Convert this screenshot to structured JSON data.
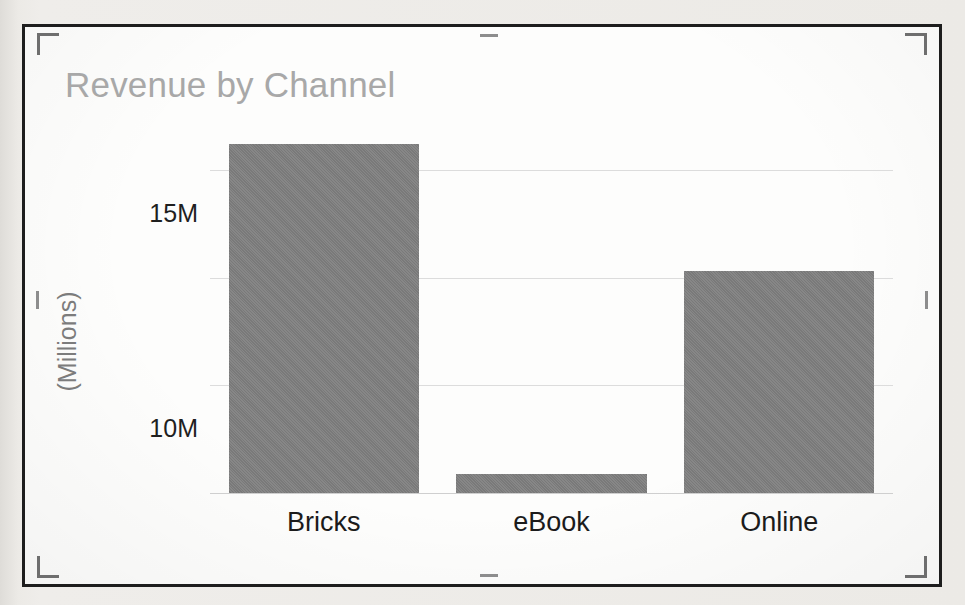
{
  "figure": {
    "crop_marks": [
      {
        "name": "crop-mark-top-left"
      },
      {
        "name": "crop-mark-top-right"
      },
      {
        "name": "crop-mark-bottom-left"
      },
      {
        "name": "crop-mark-bottom-right"
      }
    ],
    "edge_ticks": [
      {
        "name": "edge-tick-top"
      },
      {
        "name": "edge-tick-bottom"
      },
      {
        "name": "edge-tick-left"
      },
      {
        "name": "edge-tick-right"
      }
    ],
    "frame_color": "#1d1d1d",
    "page_background": "#e9e9e7",
    "figure_background": "#fdfdfc"
  },
  "chart_data": {
    "type": "bar",
    "title": "Revenue by Channel",
    "xlabel": "",
    "ylabel": "(Millions)",
    "categories": [
      "Bricks",
      "eBook",
      "Online"
    ],
    "values": [
      16.2,
      0.9,
      10.3
    ],
    "value_unit": "M",
    "ylim": [
      0,
      17.0
    ],
    "yticks": [
      0,
      5,
      10,
      15
    ],
    "ytick_labels": [
      "0M",
      "5M",
      "10M",
      "15M"
    ],
    "grid": true,
    "grid_axis": "y",
    "legend": false,
    "legend_position": "none",
    "series": [
      {
        "name": "Revenue",
        "color": "#808080",
        "values": [
          16.2,
          0.9,
          10.3
        ]
      }
    ],
    "colors": {
      "bar": "#808080",
      "gridline": "#dcdcdc",
      "title_text": "#a8a8a8",
      "axis_text": "#1f1f1f",
      "axis_title_text": "#7c7c7c"
    }
  }
}
